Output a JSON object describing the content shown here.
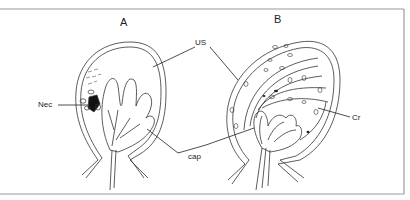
{
  "figure": {
    "panels": [
      {
        "id": "A",
        "label": "A"
      },
      {
        "id": "B",
        "label": "B"
      }
    ],
    "annotations": {
      "us": "US",
      "nec": "Nec",
      "cap": "cap",
      "cr": "Cr"
    },
    "colors": {
      "line": "#333333",
      "frame": "#9a9a9a",
      "background": "#ffffff"
    }
  }
}
